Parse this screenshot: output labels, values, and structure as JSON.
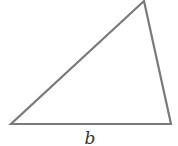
{
  "diagram": {
    "type": "triangle",
    "stroke_color": "#7a7a7a",
    "vertices": {
      "top": [
        144,
        1
      ],
      "bottom_left": [
        11,
        124
      ],
      "bottom_right": [
        171,
        124
      ]
    },
    "labels": {
      "base": "b"
    }
  }
}
